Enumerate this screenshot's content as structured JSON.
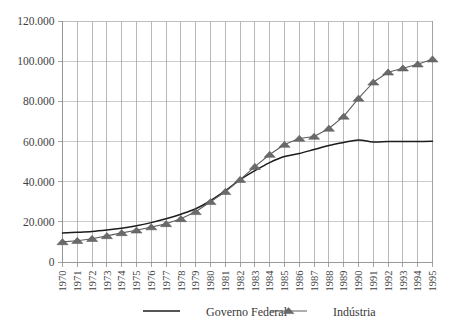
{
  "chart_data": {
    "type": "line",
    "title": "",
    "subtitle": "",
    "xlabel": "",
    "ylabel": "",
    "grid": true,
    "legend_position": "bottom",
    "xlim": [
      1970,
      1995
    ],
    "ylim": [
      0,
      120000
    ],
    "ytick_step": 20000,
    "categories": [
      "1970",
      "1971",
      "1972",
      "1973",
      "1974",
      "1975",
      "1976",
      "1977",
      "1978",
      "1979",
      "1980",
      "1981",
      "1982",
      "1983",
      "1984",
      "1985",
      "1986",
      "1987",
      "1988",
      "1989",
      "1990",
      "1991",
      "1992",
      "1993",
      "1994",
      "1995"
    ],
    "ytick_labels": [
      "0",
      "20.000",
      "40.000",
      "60.000",
      "80.000",
      "100.000",
      "120.000"
    ],
    "ytick_values": [
      0,
      20000,
      40000,
      60000,
      80000,
      100000,
      120000
    ],
    "series": [
      {
        "name": "Governo Federal",
        "marker": "none",
        "color": "#1c1c1c",
        "values": [
          14500,
          14800,
          15200,
          15900,
          16800,
          18000,
          19600,
          21500,
          23800,
          26500,
          30500,
          35500,
          41000,
          45500,
          49500,
          52500,
          54000,
          56000,
          58000,
          59500,
          60800,
          59800,
          60000,
          60000,
          60000,
          60100
        ]
      },
      {
        "name": "Indústria",
        "marker": "triangle",
        "color": "#6a6a6a",
        "values": [
          10000,
          10600,
          11600,
          13000,
          14500,
          15800,
          17400,
          19000,
          21500,
          25000,
          30000,
          35000,
          41000,
          47500,
          53500,
          58500,
          61500,
          62500,
          66500,
          72500,
          81500,
          89500,
          94500,
          96500,
          98500,
          101000
        ]
      }
    ]
  },
  "legend": {
    "items": [
      {
        "label": "Governo Federal",
        "marker": "line"
      },
      {
        "label": "Indústria",
        "marker": "line-triangle"
      }
    ]
  }
}
